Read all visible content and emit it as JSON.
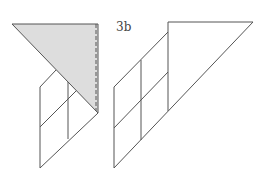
{
  "figure": {
    "label": "3b",
    "colors": {
      "stroke": "#555555",
      "shade": "#dddddd",
      "background": "#ffffff"
    }
  }
}
